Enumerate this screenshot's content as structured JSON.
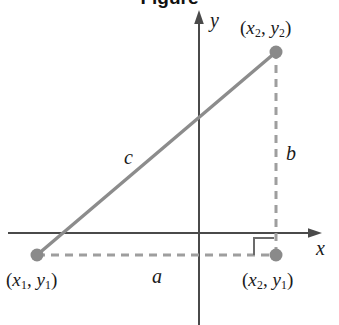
{
  "figure": {
    "title_partial": "Figure",
    "type": "geometry-diagram",
    "colors": {
      "axis": "#4a4a4a",
      "hypotenuse": "#8c8c8c",
      "dashed": "#9e9e9e",
      "point": "#8a8a8a",
      "text": "#1a1a1a",
      "background": "#ffffff"
    },
    "axes": {
      "x_label": "x",
      "y_label": "y",
      "origin": {
        "x": 199,
        "y": 233
      }
    },
    "points": [
      {
        "id": "p1",
        "label_open": "(",
        "var1": "x",
        "sub1": "1",
        "sep": ", ",
        "var2": "y",
        "sub2": "1",
        "label_close": ")",
        "px": 37,
        "py": 255
      },
      {
        "id": "p2",
        "label_open": "(",
        "var1": "x",
        "sub1": "2",
        "sep": ", ",
        "var2": "y",
        "sub2": "2",
        "label_close": ")",
        "px": 276,
        "py": 52
      },
      {
        "id": "p3",
        "label_open": "(",
        "var1": "x",
        "sub1": "2",
        "sep": ", ",
        "var2": "y",
        "sub2": "1",
        "label_close": ")",
        "px": 276,
        "py": 255
      }
    ],
    "sides": {
      "a_label": "a",
      "b_label": "b",
      "c_label": "c"
    },
    "right_angle_marker": true
  }
}
